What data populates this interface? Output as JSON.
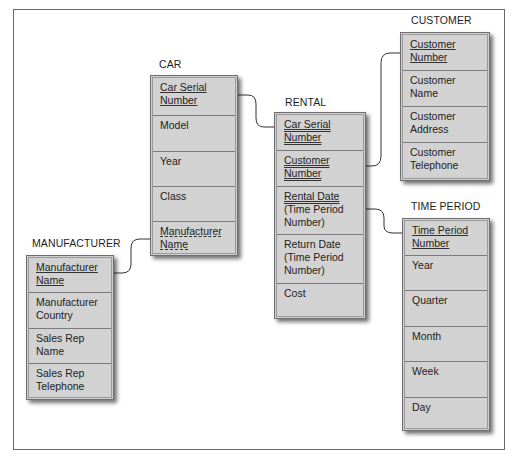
{
  "diagram": {
    "type": "entity-relationship",
    "entities": [
      {
        "name": "CAR",
        "attributes": [
          {
            "label": "Car Serial Number",
            "lines": [
              "Car Serial",
              "Number"
            ],
            "key": "primary"
          },
          {
            "label": "Model",
            "lines": [
              "Model"
            ],
            "key": "none"
          },
          {
            "label": "Year",
            "lines": [
              "Year"
            ],
            "key": "none"
          },
          {
            "label": "Class",
            "lines": [
              "Class"
            ],
            "key": "none"
          },
          {
            "label": "Manufacturer Name",
            "lines": [
              "Manufacturer",
              "Name"
            ],
            "key": "foreign"
          }
        ]
      },
      {
        "name": "RENTAL",
        "attributes": [
          {
            "label": "Car Serial Number",
            "lines": [
              "Car Serial",
              "Number"
            ],
            "key": "primary-foreign"
          },
          {
            "label": "Customer Number",
            "lines": [
              "Customer",
              "Number"
            ],
            "key": "primary-foreign"
          },
          {
            "label": "Rental Date (Time Period Number)",
            "lines": [
              "Rental Date",
              "(Time Period",
              "Number)"
            ],
            "key": "primary-foreign"
          },
          {
            "label": "Return Date (Time Period Number)",
            "lines": [
              "Return Date",
              "(Time Period",
              "Number)"
            ],
            "key": "none"
          },
          {
            "label": "Cost",
            "lines": [
              "Cost"
            ],
            "key": "none"
          }
        ]
      },
      {
        "name": "CUSTOMER",
        "attributes": [
          {
            "label": "Customer Number",
            "lines": [
              "Customer",
              "Number"
            ],
            "key": "primary"
          },
          {
            "label": "Customer Name",
            "lines": [
              "Customer",
              "Name"
            ],
            "key": "none"
          },
          {
            "label": "Customer Address",
            "lines": [
              "Customer",
              "Address"
            ],
            "key": "none"
          },
          {
            "label": "Customer Telephone",
            "lines": [
              "Customer",
              "Telephone"
            ],
            "key": "none"
          }
        ]
      },
      {
        "name": "TIME PERIOD",
        "attributes": [
          {
            "label": "Time Period Number",
            "lines": [
              "Time Period",
              "Number"
            ],
            "key": "primary"
          },
          {
            "label": "Year",
            "lines": [
              "Year"
            ],
            "key": "none"
          },
          {
            "label": "Quarter",
            "lines": [
              "Quarter"
            ],
            "key": "none"
          },
          {
            "label": "Month",
            "lines": [
              "Month"
            ],
            "key": "none"
          },
          {
            "label": "Week",
            "lines": [
              "Week"
            ],
            "key": "none"
          },
          {
            "label": "Day",
            "lines": [
              "Day"
            ],
            "key": "none"
          }
        ]
      },
      {
        "name": "MANUFACTURER",
        "attributes": [
          {
            "label": "Manufacturer Name",
            "lines": [
              "Manufacturer",
              "Name"
            ],
            "key": "primary"
          },
          {
            "label": "Manufacturer Country",
            "lines": [
              "Manufacturer",
              "Country"
            ],
            "key": "none"
          },
          {
            "label": "Sales Rep Name",
            "lines": [
              "Sales Rep",
              "Name"
            ],
            "key": "none"
          },
          {
            "label": "Sales Rep Telephone",
            "lines": [
              "Sales Rep",
              "Telephone"
            ],
            "key": "none"
          }
        ]
      }
    ],
    "relationships": [
      {
        "from": "CAR.Car Serial Number",
        "to": "RENTAL.Car Serial Number"
      },
      {
        "from": "CUSTOMER.Customer Number",
        "to": "RENTAL.Customer Number"
      },
      {
        "from": "TIME PERIOD.Time Period Number",
        "to": "RENTAL.Rental Date (Time Period Number)"
      },
      {
        "from": "MANUFACTURER.Manufacturer Name",
        "to": "CAR.Manufacturer Name"
      }
    ]
  },
  "colors": {
    "entity_fill": "#cfcfcf",
    "entity_border": "#6e6e6e",
    "frame_border": "#6a6a6a",
    "connector": "#333333"
  }
}
